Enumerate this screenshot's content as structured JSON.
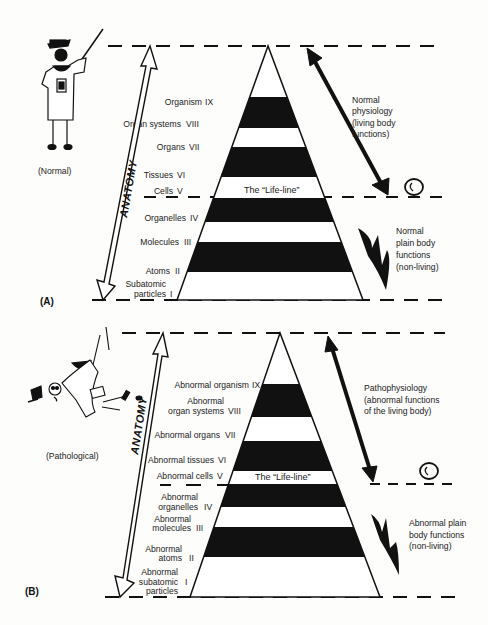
{
  "figure": {
    "panels": [
      {
        "id": "A",
        "panel_label": "(A)",
        "condition_label": "(Normal)",
        "axis_label": "ANATOMY",
        "life_line_label": "The “Life-line”",
        "levels": [
          {
            "name": "Organism",
            "numeral": "IX"
          },
          {
            "name": "Organ systems",
            "numeral": "VIII"
          },
          {
            "name": "Organs",
            "numeral": "VII"
          },
          {
            "name": "Tissues",
            "numeral": "VI"
          },
          {
            "name": "Cells",
            "numeral": "V"
          },
          {
            "name": "Organelles",
            "numeral": "IV"
          },
          {
            "name": "Molecules",
            "numeral": "III"
          },
          {
            "name": "Atoms",
            "numeral": "II"
          },
          {
            "name": "Subatomic particles",
            "numeral": "I"
          }
        ],
        "upper_annotation": [
          "Normal",
          "physiology",
          "(living body",
          "functions)"
        ],
        "lower_annotation": [
          "Normal",
          "plain body",
          "functions",
          "(non-living)"
        ],
        "figure_icon": "professor-skeleton-pointing-icon",
        "cell_icon": "cell-icon"
      },
      {
        "id": "B",
        "panel_label": "(B)",
        "condition_label": "(Pathological)",
        "axis_label": "ANATOMY",
        "life_line_label": "The “Life-line”",
        "levels": [
          {
            "name": "Abnormal organism",
            "numeral": "IX"
          },
          {
            "name": "Abnormal organ systems",
            "numeral": "VIII"
          },
          {
            "name": "Abnormal organs",
            "numeral": "VII"
          },
          {
            "name": "Abnormal tissues",
            "numeral": "VI"
          },
          {
            "name": "Abnormal cells",
            "numeral": "V"
          },
          {
            "name": "Abnormal organelles",
            "numeral": "IV"
          },
          {
            "name": "Abnormal molecules",
            "numeral": "III"
          },
          {
            "name": "Abnormal atoms",
            "numeral": "II"
          },
          {
            "name": "Abnormal subatomic particles",
            "numeral": "I"
          }
        ],
        "upper_annotation": [
          "Pathophysiology",
          "(abnormal functions",
          "of the living body)"
        ],
        "lower_annotation": [
          "Abnormal plain",
          "body functions",
          "(non-living)"
        ],
        "figure_icon": "fallen-professor-skeleton-icon",
        "cell_icon": "cell-icon"
      }
    ],
    "colors": {
      "ink": "#111111",
      "paper": "#fdfdfc",
      "text": "#222222"
    }
  },
  "labels_A": {
    "organism": "Organism",
    "organism_n": "IX",
    "organ_systems": "Organ systems",
    "organ_systems_n": "VIII",
    "organs": "Organs",
    "organs_n": "VII",
    "tissues": "Tissues",
    "tissues_n": "VI",
    "cells": "Cells",
    "cells_n": "V",
    "organelles": "Organelles",
    "organelles_n": "IV",
    "molecules": "Molecules",
    "molecules_n": "III",
    "atoms": "Atoms",
    "atoms_n": "II",
    "subatomic_1": "Subatomic",
    "subatomic_2": "particles",
    "subatomic_n": "I",
    "life_line": "The “Life-line”",
    "normal": "(Normal)",
    "panel": "(A)",
    "anatomy": "ANATOMY",
    "up1": "Normal",
    "up2": "physiology",
    "up3": "(living body",
    "up4": "functions)",
    "lo1": "Normal",
    "lo2": "plain body",
    "lo3": "functions",
    "lo4": "(non-living)"
  },
  "labels_B": {
    "organism": "Abnormal organism",
    "organism_n": "IX",
    "organ_systems_1": "Abnormal",
    "organ_systems_2": "organ systems",
    "organ_systems_n": "VIII",
    "organs": "Abnormal organs",
    "organs_n": "VII",
    "tissues": "Abnormal tissues",
    "tissues_n": "VI",
    "cells": "Abnormal cells",
    "cells_n": "V",
    "organelles_1": "Abnormal",
    "organelles_2": "organelles",
    "organelles_n": "IV",
    "molecules_1": "Abnormal",
    "molecules_2": "molecules",
    "molecules_n": "III",
    "atoms_1": "Abnormal",
    "atoms_2": "atoms",
    "atoms_n": "II",
    "subatomic_1": "Abnormal",
    "subatomic_2": "subatomic",
    "subatomic_3": "particles",
    "subatomic_n": "I",
    "life_line": "The “Life-line”",
    "pathological": "(Pathological)",
    "panel": "(B)",
    "anatomy": "ANATOMY",
    "up1": "Pathophysiology",
    "up2": "(abnormal functions",
    "up3": "of the living body)",
    "lo1": "Abnormal plain",
    "lo2": "body functions",
    "lo3": "(non-living)"
  }
}
